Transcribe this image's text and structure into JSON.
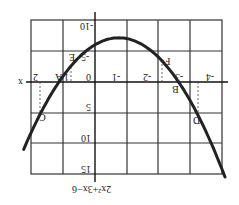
{
  "chart_data": {
    "type": "line",
    "title": "2x²+3x−6",
    "function": "y = 2x^2 + 3x - 6",
    "rotation_deg": 180,
    "xlabel": "x",
    "ylabel": "",
    "x_ticks": [
      -4,
      -3,
      -2,
      -1,
      0,
      1,
      2
    ],
    "y_ticks": [
      -10,
      -5,
      0,
      5,
      10,
      15
    ],
    "xlim": [
      -4.2,
      2.1
    ],
    "ylim": [
      -10,
      15
    ],
    "grid": true,
    "series": [
      {
        "name": "2x²+3x−6",
        "x": [
          -4.1,
          -3.5,
          -3,
          -2.5,
          -2,
          -1.5,
          -1,
          -0.75,
          -0.5,
          0,
          0.5,
          1,
          1.5,
          2,
          2.2
        ],
        "values": [
          15.32,
          7.0,
          3.0,
          -1.0,
          -4.0,
          -6.0,
          -7.0,
          -7.125,
          -7.0,
          -6.0,
          -4.0,
          -1.0,
          3.0,
          8.0,
          10.28
        ]
      }
    ],
    "annotations": [
      {
        "label": "A",
        "x": 1.14,
        "y": 0
      },
      {
        "label": "B",
        "x": -2.64,
        "y": 0
      },
      {
        "label": "C",
        "x": 1.75,
        "y": 5.4
      },
      {
        "label": "D",
        "x": -3.3,
        "y": 5.9
      },
      {
        "label": "E",
        "x": 0.75,
        "y": -2.6
      },
      {
        "label": "F",
        "x": -2.1,
        "y": -3.5
      }
    ]
  },
  "labels": {
    "x_axis": "x",
    "equation": "2x²+3x−6",
    "x_ticks": [
      "-4",
      "-3",
      "-2",
      "-1",
      "0",
      "1",
      "2"
    ],
    "y_ticks": [
      "-10",
      "-5",
      "5",
      "10",
      "15"
    ],
    "points": [
      "A",
      "B",
      "C",
      "D",
      "E",
      "F"
    ]
  }
}
